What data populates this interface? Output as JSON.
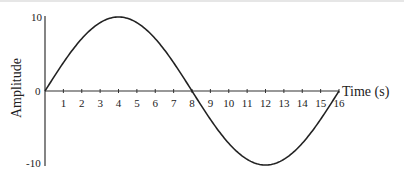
{
  "chart_data": {
    "type": "line",
    "title": "",
    "xlabel": "Time (s)",
    "ylabel": "Amplitude",
    "xlim": [
      0,
      16
    ],
    "ylim": [
      -10,
      10
    ],
    "x_ticks": [
      1,
      2,
      3,
      4,
      5,
      6,
      7,
      8,
      9,
      10,
      11,
      12,
      13,
      14,
      15,
      16
    ],
    "y_ticks": [
      10,
      0,
      -10
    ],
    "grid": false,
    "legend": null,
    "series": [
      {
        "name": "Amplitude",
        "description": "sine wave, amplitude 10, period 16 s",
        "x": [
          0,
          1,
          2,
          3,
          4,
          5,
          6,
          7,
          8,
          9,
          10,
          11,
          12,
          13,
          14,
          15,
          16
        ],
        "values": [
          0,
          3.83,
          7.07,
          9.24,
          10,
          9.24,
          7.07,
          3.83,
          0,
          -3.83,
          -7.07,
          -9.24,
          -10,
          -9.24,
          -7.07,
          -3.83,
          0
        ]
      }
    ],
    "colors": {
      "line": "#222222",
      "axis": "#333333"
    }
  },
  "labels": {
    "y_top": "10",
    "y_zero": "0",
    "y_bottom": "-10",
    "x_title": "Time (s)",
    "y_title": "Amplitude",
    "x_ticks": [
      "1",
      "2",
      "3",
      "4",
      "5",
      "6",
      "7",
      "8",
      "9",
      "10",
      "11",
      "12",
      "13",
      "14",
      "15",
      "16"
    ]
  }
}
